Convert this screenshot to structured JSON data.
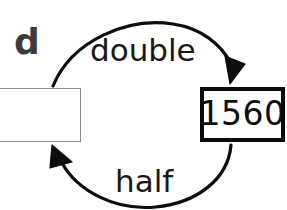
{
  "diagram": {
    "type": "function-machine-cycle",
    "corner_label": "d",
    "operations": {
      "top_arrow_label": "double",
      "bottom_arrow_label": "half"
    },
    "boxes": [
      {
        "name": "input-box",
        "value": "",
        "border_color": "#8c8c8c",
        "border_weight": "thin"
      },
      {
        "name": "result-box",
        "value": "1560",
        "border_color": "#0a0a0a",
        "border_weight": "thick"
      }
    ],
    "arrows": [
      {
        "name": "double-arrow",
        "direction": "left-to-right",
        "label": "double",
        "color": "#0a0a0a"
      },
      {
        "name": "half-arrow",
        "direction": "right-to-left",
        "label": "half",
        "color": "#0a0a0a"
      }
    ],
    "colors": {
      "background": "#ffffff",
      "ink": "#0a0a0a",
      "muted_ink": "#3b3b3b",
      "thin_border": "#8c8c8c"
    }
  }
}
